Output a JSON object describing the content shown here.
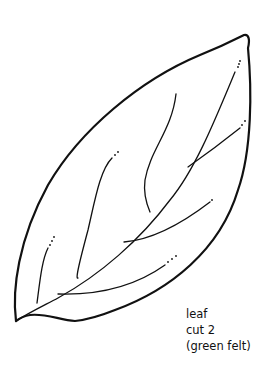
{
  "pattern": {
    "name": "leaf",
    "caption": {
      "line1": "leaf",
      "line2": "cut 2",
      "line3": "(green felt)"
    },
    "colors": {
      "stroke": "#111111",
      "background": "#ffffff"
    }
  }
}
